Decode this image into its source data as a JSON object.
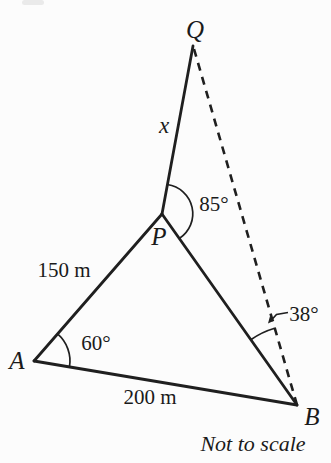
{
  "diagram": {
    "points": {
      "q": "Q",
      "p": "P",
      "a": "A",
      "b": "B"
    },
    "sides": {
      "pq": "x",
      "ap": "150 m",
      "ab": "200 m"
    },
    "angles": {
      "at_p": "85°",
      "at_a": "60°",
      "at_b": "38°"
    },
    "note": "Not to scale",
    "colors": {
      "line": "#1f1f1f",
      "background": "#fcfcfc",
      "text": "#1a1a1a"
    }
  }
}
